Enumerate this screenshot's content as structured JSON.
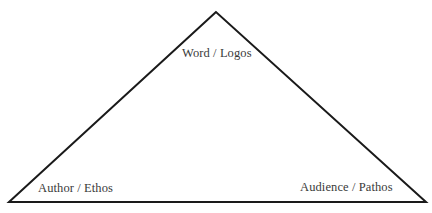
{
  "diagram": {
    "type": "rhetorical-triangle",
    "vertices": {
      "top": "Word / Logos",
      "bottom_left": "Author / Ethos",
      "bottom_right": "Audience / Pathos"
    },
    "line_color": "#1a1a1a",
    "text_color": "#3a3a3a",
    "background_color": "#ffffff"
  }
}
